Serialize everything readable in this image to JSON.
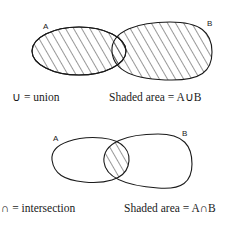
{
  "union_figure": {
    "set_a_label": "A",
    "set_b_label": "B",
    "symbol_definition": "∪ = union",
    "shaded_caption": "Shaded area = A∪B"
  },
  "intersection_figure": {
    "set_a_label": "A",
    "set_b_label": "B",
    "symbol_definition": "∩ = intersection",
    "shaded_caption": "Shaded area = A∩B"
  },
  "colors": {
    "ink": "#1a1a1a",
    "background": "#ffffff"
  }
}
